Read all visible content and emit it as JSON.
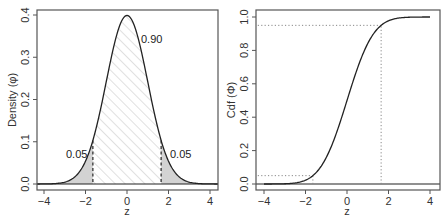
{
  "chart_data": [
    {
      "type": "area",
      "title": "",
      "xlabel": "z",
      "ylabel": "Density (φ)",
      "xlim": [
        -4.3,
        4.3
      ],
      "ylim": [
        -0.015,
        0.415
      ],
      "xticks": [
        -4,
        -2,
        0,
        2,
        4
      ],
      "xtick_labels": [
        "−4",
        "−2",
        "0",
        "2",
        "4"
      ],
      "yticks": [
        0.0,
        0.1,
        0.2,
        0.3,
        0.4
      ],
      "ytick_labels": [
        "0.0",
        "0.1",
        "0.2",
        "0.3",
        "0.4"
      ],
      "grid": false,
      "series": [
        {
          "name": "Standard normal density",
          "x": [
            -4,
            -3.5,
            -3,
            -2.5,
            -2,
            -1.645,
            -1.5,
            -1,
            -0.5,
            0,
            0.5,
            1,
            1.5,
            1.645,
            2,
            2.5,
            3,
            3.5,
            4
          ],
          "y": [
            0.0001,
            0.0009,
            0.0044,
            0.0175,
            0.054,
            0.1031,
            0.1295,
            0.242,
            0.3521,
            0.3989,
            0.3521,
            0.242,
            0.1295,
            0.1031,
            0.054,
            0.0175,
            0.0044,
            0.0009,
            0.0001
          ]
        }
      ],
      "regions": [
        {
          "name": "left-tail",
          "from": -4.3,
          "to": -1.645,
          "fill": "#d3d3d3",
          "label": "0.05"
        },
        {
          "name": "center",
          "from": -1.645,
          "to": 1.645,
          "fill": "hatched",
          "label": "0.90"
        },
        {
          "name": "right-tail",
          "from": 1.645,
          "to": 4.3,
          "fill": "#d3d3d3",
          "label": "0.05"
        }
      ],
      "vlines": [
        {
          "x": -1.645,
          "style": "dashed"
        },
        {
          "x": 1.645,
          "style": "dashed"
        }
      ],
      "annotations": [
        {
          "text": "0.90",
          "x": 0.55,
          "y": 0.35
        },
        {
          "text": "0.05",
          "x": -2.3,
          "y": 0.07
        },
        {
          "text": "0.05",
          "x": 2.3,
          "y": 0.07
        }
      ]
    },
    {
      "type": "line",
      "title": "",
      "xlabel": "z",
      "ylabel": "Cdf (Φ)",
      "xlim": [
        -4.3,
        4.3
      ],
      "ylim": [
        -0.035,
        1.04
      ],
      "xticks": [
        -4,
        -2,
        0,
        2,
        4
      ],
      "xtick_labels": [
        "−4",
        "−2",
        "0",
        "2",
        "4"
      ],
      "yticks": [
        0.0,
        0.2,
        0.4,
        0.6,
        0.8,
        1.0
      ],
      "ytick_labels": [
        "0.0",
        "0.2",
        "0.4",
        "0.6",
        "0.8",
        "1.0"
      ],
      "grid": false,
      "series": [
        {
          "name": "Standard normal CDF",
          "x": [
            -4,
            -3.5,
            -3,
            -2.5,
            -2,
            -1.645,
            -1.5,
            -1,
            -0.5,
            0,
            0.5,
            1,
            1.5,
            1.645,
            2,
            2.5,
            3,
            3.5,
            4
          ],
          "y": [
            0.0,
            0.0002,
            0.0013,
            0.0062,
            0.0228,
            0.05,
            0.0668,
            0.1587,
            0.3085,
            0.5,
            0.6915,
            0.8413,
            0.9332,
            0.95,
            0.9772,
            0.9938,
            0.9987,
            0.9998,
            1.0
          ]
        }
      ],
      "guides": [
        {
          "type": "hline",
          "y": 0.95,
          "x_from": -4.3,
          "x_to": 1.645,
          "style": "dotted"
        },
        {
          "type": "vline",
          "x": 1.645,
          "y_from": 0.0,
          "y_to": 0.95,
          "style": "dotted"
        },
        {
          "type": "hline",
          "y": 0.05,
          "x_from": -4.3,
          "x_to": -1.645,
          "style": "dotted"
        },
        {
          "type": "vline",
          "x": -1.645,
          "y_from": 0.0,
          "y_to": 0.05,
          "style": "dotted"
        }
      ]
    }
  ],
  "colors": {
    "axis": "#555555",
    "curve": "#222222",
    "tail_fill": "#d3d3d3",
    "hatch": "#cfcfcf",
    "guide": "#888888"
  }
}
